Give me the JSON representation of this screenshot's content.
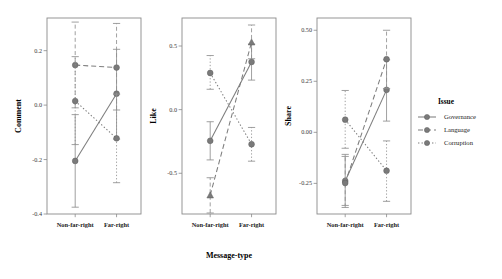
{
  "figure": {
    "xlabel": "Message-type",
    "legend_title": "Issue"
  },
  "legend": {
    "title": "Issue",
    "items": [
      {
        "label": "Governance",
        "style": "solid",
        "color": "#7a7a7a"
      },
      {
        "label": "Language",
        "style": "dashed",
        "color": "#7a7a7a"
      },
      {
        "label": "Corruption",
        "style": "dotted",
        "color": "#7a7a7a"
      }
    ]
  },
  "chart_data": {
    "type": "line",
    "title": "",
    "xlabel": "Message-type",
    "categories": [
      "Non-far-right",
      "Far-right"
    ],
    "legend_position": "right",
    "grid": false,
    "panels": [
      {
        "ylabel": "Comment",
        "ylim": [
          -0.4,
          0.32
        ],
        "yticks": [
          0.2,
          0.0,
          -0.2,
          -0.4
        ],
        "ytick_labels": [
          "0.2",
          "0.0",
          "-0.2",
          "-0.4"
        ],
        "series": [
          {
            "name": "Governance",
            "style": "solid",
            "marker": "circle",
            "values": [
              -0.205,
              0.042
            ],
            "ci_low": [
              -0.375,
              -0.125
            ],
            "ci_high": [
              -0.035,
              0.205
            ]
          },
          {
            "name": "Language",
            "style": "dashed",
            "marker": "circle",
            "values": [
              0.147,
              0.138
            ],
            "ci_low": [
              -0.01,
              -0.018
            ],
            "ci_high": [
              0.305,
              0.3
            ]
          },
          {
            "name": "Corruption",
            "style": "dotted",
            "marker": "circle",
            "values": [
              0.015,
              -0.122
            ],
            "ci_low": [
              -0.145,
              -0.285
            ],
            "ci_high": [
              0.178,
              0.04
            ]
          }
        ]
      },
      {
        "ylabel": "Like",
        "ylim": [
          -0.82,
          0.72
        ],
        "yticks": [
          0.5,
          0.0,
          -0.5
        ],
        "ytick_labels": [
          "0.5",
          "0.0",
          "-0.5"
        ],
        "series": [
          {
            "name": "Governance",
            "style": "solid",
            "marker": "circle",
            "values": [
              -0.245,
              0.375
            ],
            "ci_low": [
              -0.395,
              0.232
            ],
            "ci_high": [
              -0.095,
              0.515
            ]
          },
          {
            "name": "Language",
            "style": "dashed",
            "marker": "triangle",
            "values": [
              -0.672,
              0.53
            ],
            "ci_low": [
              -0.812,
              0.4
            ],
            "ci_high": [
              -0.535,
              0.665
            ]
          },
          {
            "name": "Corruption",
            "style": "dotted",
            "marker": "circle",
            "values": [
              0.288,
              -0.272
            ],
            "ci_low": [
              0.16,
              -0.405
            ],
            "ci_high": [
              0.425,
              -0.14
            ]
          }
        ]
      },
      {
        "ylabel": "Share",
        "ylim": [
          -0.4,
          0.56
        ],
        "yticks": [
          0.5,
          0.25,
          0.0,
          -0.25
        ],
        "ytick_labels": [
          "0.50",
          "0.25",
          "0.00",
          "-0.25"
        ],
        "series": [
          {
            "name": "Governance",
            "style": "solid",
            "marker": "circle",
            "values": [
              -0.238,
              0.208
            ],
            "ci_low": [
              -0.358,
              0.055
            ],
            "ci_high": [
              -0.108,
              0.355
            ]
          },
          {
            "name": "Language",
            "style": "dashed",
            "marker": "circle",
            "values": [
              -0.248,
              0.358
            ],
            "ci_low": [
              -0.368,
              0.215
            ],
            "ci_high": [
              -0.118,
              0.5
            ]
          },
          {
            "name": "Corruption",
            "style": "dotted",
            "marker": "circle",
            "values": [
              0.062,
              -0.188
            ],
            "ci_low": [
              -0.078,
              -0.338
            ],
            "ci_high": [
              0.205,
              -0.042
            ]
          }
        ]
      }
    ]
  }
}
